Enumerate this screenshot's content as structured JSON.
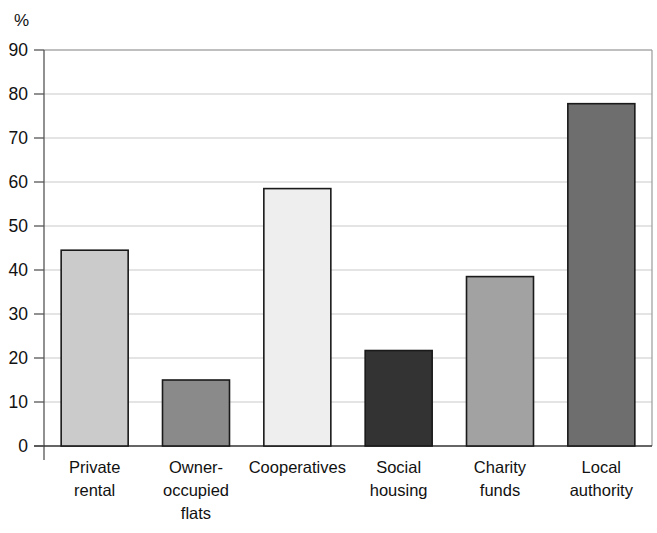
{
  "chart_data": {
    "type": "bar",
    "title": "",
    "subtitle": "",
    "xlabel": "",
    "ylabel": "%",
    "ylim": [
      0,
      90
    ],
    "yticks": [
      0,
      10,
      20,
      30,
      40,
      50,
      60,
      70,
      80,
      90
    ],
    "ytick_labels": [
      "0",
      "10",
      "20",
      "30",
      "40",
      "50",
      "60",
      "70",
      "80",
      "90"
    ],
    "grid": true,
    "grid_axis": "y",
    "legend": false,
    "legend_position": "none",
    "categories": [
      "Private rental",
      "Owner-occupied flats",
      "Cooperatives",
      "Social housing",
      "Charity funds",
      "Local authority"
    ],
    "category_lines": [
      [
        "Private",
        "rental"
      ],
      [
        "Owner-",
        "occupied",
        "flats"
      ],
      [
        "Cooperatives"
      ],
      [
        "Social",
        "housing"
      ],
      [
        "Charity",
        "funds"
      ],
      [
        "Local",
        "authority"
      ]
    ],
    "values": [
      44.5,
      15.0,
      58.5,
      21.7,
      38.5,
      77.8
    ],
    "bar_colors": [
      "#cbcbcb",
      "#8a8a8a",
      "#eeeeee",
      "#333333",
      "#a2a2a2",
      "#6e6e6e"
    ],
    "bar_edge_color": "#1a1a1a",
    "grid_color": "#c9c9c9",
    "axis_color": "#555555",
    "plot_border_color": "#9a9a9a",
    "background_color": "#ffffff"
  },
  "axis": {
    "unit_label": "%"
  }
}
